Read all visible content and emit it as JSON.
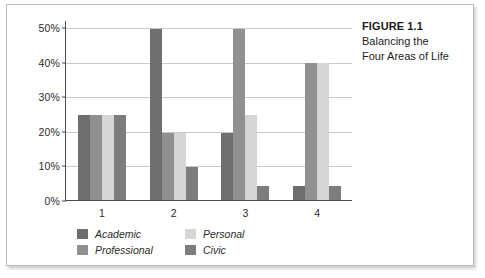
{
  "caption": {
    "title": "FIGURE 1.1",
    "line1": "Balancing the",
    "line2": "Four Areas of Life"
  },
  "chart_data": {
    "type": "bar",
    "title": "",
    "xlabel": "",
    "ylabel": "",
    "ylim": [
      0,
      50
    ],
    "ytick_labels": [
      "0%",
      "10%",
      "20%",
      "30%",
      "40%",
      "50%"
    ],
    "ytick_values": [
      0,
      10,
      20,
      30,
      40,
      50
    ],
    "grid": true,
    "legend_position": "bottom",
    "categories": [
      "1",
      "2",
      "3",
      "4"
    ],
    "series": [
      {
        "name": "Academic",
        "color": "#6e6e6e",
        "values": [
          24.5,
          49.5,
          19.5,
          4.0
        ]
      },
      {
        "name": "Professional",
        "color": "#909090",
        "values": [
          24.5,
          19.5,
          49.5,
          39.5
        ]
      },
      {
        "name": "Personal",
        "color": "#d6d6d6",
        "values": [
          24.5,
          19.5,
          24.5,
          39.5
        ]
      },
      {
        "name": "Civic",
        "color": "#7d7d7d",
        "values": [
          24.5,
          9.5,
          4.0,
          4.0
        ]
      }
    ],
    "legend_order": [
      "Academic",
      "Personal",
      "Professional",
      "Civic"
    ]
  }
}
